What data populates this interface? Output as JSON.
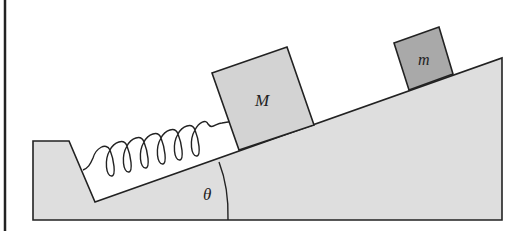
{
  "diagram": {
    "labels": {
      "large_block": "M",
      "small_block": "m",
      "angle": "θ"
    },
    "colors": {
      "incline_fill": "#dedede",
      "large_block_fill": "#d3d3d3",
      "small_block_fill": "#a9a9a9",
      "stroke": "#222222",
      "background": "#ffffff"
    }
  }
}
